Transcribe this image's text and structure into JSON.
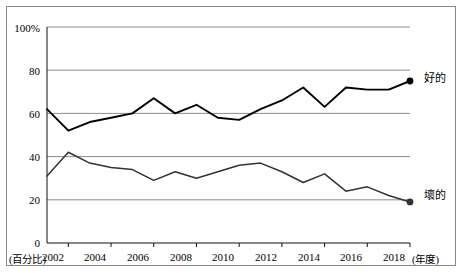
{
  "chart_data": {
    "type": "line",
    "title": "",
    "xlabel": "(年度)",
    "ylabel": "(百分比)",
    "ylim": [
      0,
      100
    ],
    "xlim": [
      2001,
      2018
    ],
    "grid": true,
    "y_ticks": [
      "0",
      "20",
      "40",
      "60",
      "80",
      "100%"
    ],
    "y_tick_values": [
      0,
      20,
      40,
      60,
      80,
      100
    ],
    "x_ticks": [
      "2002",
      "2004",
      "2006",
      "2008",
      "2010",
      "2012",
      "2014",
      "2016",
      "2018"
    ],
    "x_tick_values": [
      2002,
      2004,
      2006,
      2008,
      2010,
      2012,
      2014,
      2016,
      2018
    ],
    "x": [
      2001,
      2002,
      2003,
      2004,
      2005,
      2006,
      2007,
      2008,
      2009,
      2010,
      2011,
      2012,
      2013,
      2014,
      2015,
      2016,
      2017,
      2018
    ],
    "legend_position": "right-end-of-line",
    "series": [
      {
        "name": "好的",
        "values": [
          62,
          52,
          56,
          58,
          60,
          67,
          60,
          64,
          58,
          57,
          62,
          66,
          72,
          63,
          72,
          71,
          71,
          75
        ],
        "end_marker": true,
        "color": "#000000"
      },
      {
        "name": "壞的",
        "values": [
          31,
          42,
          37,
          35,
          34,
          29,
          33,
          30,
          33,
          36,
          37,
          33,
          28,
          32,
          24,
          26,
          22,
          19
        ],
        "end_marker": true,
        "color": "#333333"
      }
    ],
    "series_labels": [
      "好的",
      "壞的"
    ]
  },
  "axis": {
    "y_unit_label": "(百分比)",
    "x_unit_label": "(年度)"
  }
}
